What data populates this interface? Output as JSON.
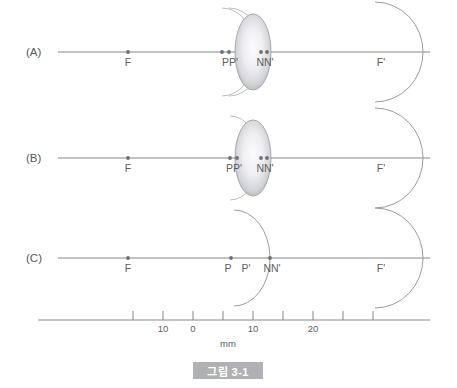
{
  "figure": {
    "caption": "그림 3-1",
    "caption_bg": "#b0b1b4",
    "caption_fg": "#ffffff"
  },
  "panels": [
    {
      "id": "A",
      "label": "(A)",
      "axis_y": 52,
      "points": [
        {
          "name": "F",
          "label": "F",
          "x": 128,
          "dot": true
        },
        {
          "name": "P",
          "label": "P",
          "x": 222,
          "dot": true
        },
        {
          "name": "Pp",
          "label": "P'",
          "x": 229,
          "dot": true
        },
        {
          "name": "N",
          "label": "N",
          "x": 261,
          "dot": true
        },
        {
          "name": "Np",
          "label": "N'",
          "x": 267,
          "dot": true
        },
        {
          "name": "Fp",
          "label": "F'",
          "x": 375,
          "dot": false
        }
      ],
      "label_groups": [
        {
          "text": "F",
          "x": 128,
          "anchor": "middle"
        },
        {
          "text": "PP'",
          "x": 230,
          "anchor": "middle"
        },
        {
          "text": "NN'",
          "x": 265,
          "anchor": "middle"
        },
        {
          "text": "F'",
          "x": 381,
          "anchor": "middle"
        }
      ],
      "lens": {
        "cx": 253,
        "cy": 52,
        "rx": 18,
        "ry": 38
      },
      "arcs": [
        {
          "cx": 222,
          "cy": 52,
          "rx": 34,
          "ry": 44,
          "style": "faint"
        },
        {
          "cx": 229,
          "cy": 52,
          "rx": 34,
          "ry": 44,
          "style": "faint"
        },
        {
          "cx": 375,
          "cy": 52,
          "rx": 48,
          "ry": 50,
          "style": "normal"
        }
      ]
    },
    {
      "id": "B",
      "label": "(B)",
      "axis_y": 158,
      "points": [
        {
          "name": "F",
          "label": "F",
          "x": 128,
          "dot": true
        },
        {
          "name": "P",
          "label": "P",
          "x": 230,
          "dot": true
        },
        {
          "name": "Pp",
          "label": "P'",
          "x": 237,
          "dot": true
        },
        {
          "name": "N",
          "label": "N",
          "x": 261,
          "dot": true
        },
        {
          "name": "Np",
          "label": "N'",
          "x": 267,
          "dot": true
        },
        {
          "name": "Fp",
          "label": "F'",
          "x": 375,
          "dot": false
        }
      ],
      "label_groups": [
        {
          "text": "F",
          "x": 128,
          "anchor": "middle"
        },
        {
          "text": "PP'",
          "x": 234,
          "anchor": "middle"
        },
        {
          "text": "NN'",
          "x": 265,
          "anchor": "middle"
        },
        {
          "text": "F'",
          "x": 381,
          "anchor": "middle"
        }
      ],
      "lens": {
        "cx": 253,
        "cy": 158,
        "rx": 18,
        "ry": 38
      },
      "arcs": [
        {
          "cx": 230,
          "cy": 158,
          "rx": 30,
          "ry": 42,
          "style": "faint"
        },
        {
          "cx": 375,
          "cy": 158,
          "rx": 48,
          "ry": 50,
          "style": "normal"
        }
      ]
    },
    {
      "id": "C",
      "label": "(C)",
      "axis_y": 258,
      "points": [
        {
          "name": "F",
          "label": "F",
          "x": 128,
          "dot": true
        },
        {
          "name": "P",
          "label": "P",
          "x": 231,
          "dot": true
        },
        {
          "name": "Pp",
          "label": "P'",
          "x": 245,
          "dot": false
        },
        {
          "name": "N",
          "label": "N",
          "x": 270,
          "dot": true
        },
        {
          "name": "Np",
          "label": "N'",
          "x": 278,
          "dot": false
        },
        {
          "name": "Fp",
          "label": "F'",
          "x": 375,
          "dot": false
        }
      ],
      "label_groups": [
        {
          "text": "F",
          "x": 128,
          "anchor": "middle"
        },
        {
          "text": "P",
          "x": 228,
          "anchor": "middle"
        },
        {
          "text": "P'",
          "x": 246,
          "anchor": "middle"
        },
        {
          "text": "NN'",
          "x": 272,
          "anchor": "middle"
        },
        {
          "text": "F'",
          "x": 381,
          "anchor": "middle"
        }
      ],
      "lens": null,
      "arcs": [
        {
          "cx": 234,
          "cy": 258,
          "rx": 36,
          "ry": 48,
          "style": "normal"
        },
        {
          "cx": 375,
          "cy": 258,
          "rx": 48,
          "ry": 50,
          "style": "normal"
        }
      ]
    }
  ],
  "ruler": {
    "y": 320,
    "x_start": 38,
    "x_end": 430,
    "tick_height": 9,
    "unit": "mm",
    "unit_x": 228,
    "ticks": [
      {
        "x": 133,
        "label": ""
      },
      {
        "x": 163,
        "label": "10"
      },
      {
        "x": 193,
        "label": "0"
      },
      {
        "x": 223,
        "label": ""
      },
      {
        "x": 253,
        "label": "10"
      },
      {
        "x": 283,
        "label": ""
      },
      {
        "x": 313,
        "label": "20"
      },
      {
        "x": 343,
        "label": ""
      },
      {
        "x": 373,
        "label": ""
      }
    ]
  },
  "chart_data": {
    "type": "diagram",
    "title": "그림 3-1",
    "xlabel": "mm",
    "axis_ticks_mm": [
      -20,
      -10,
      0,
      10,
      20
    ],
    "series": [
      {
        "name": "(A)",
        "cardinal_points": {
          "F": -21.5,
          "P": -0.5,
          "P_prime": 1.0,
          "N": 7.0,
          "N_prime": 8.5,
          "F_prime": 28.0
        }
      },
      {
        "name": "(B)",
        "cardinal_points": {
          "F": -21.5,
          "P": 2.0,
          "P_prime": 3.5,
          "N": 7.0,
          "N_prime": 8.5,
          "F_prime": 28.0
        }
      },
      {
        "name": "(C)",
        "cardinal_points": {
          "F": -21.5,
          "P": 2.5,
          "P_prime": 5.5,
          "N": 10.0,
          "N_prime": 12.0,
          "F_prime": 28.0
        }
      }
    ]
  }
}
